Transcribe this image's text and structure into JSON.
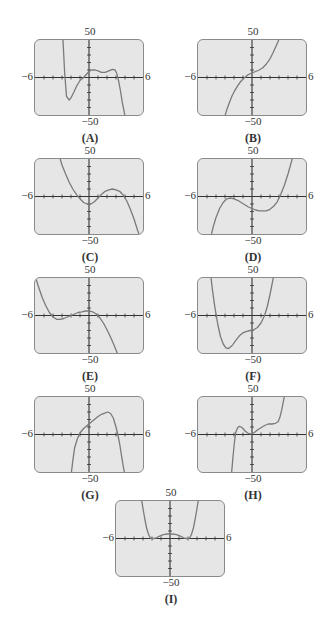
{
  "window": {
    "xmin": -6,
    "xmax": 6,
    "ymin": -50,
    "ymax": 50,
    "xscl": 1,
    "yscl": 10
  },
  "axis_labels": {
    "xmin": "−6",
    "xmax": "6",
    "ymax": "50",
    "ymin": "−50"
  },
  "chart_data": [
    {
      "label": "(A)",
      "type": "line",
      "xlim": [
        -6,
        6
      ],
      "ylim": [
        -50,
        50
      ],
      "description": "degree-5 polynomial, negative leading coefficient; local min near (-2.5,-30), small bumps between 0 and 3, falls steeply after 3.2",
      "x": [
        -2.9,
        -2.7,
        -2.5,
        -2.2,
        -2,
        -1.7,
        -1.4,
        -1,
        -0.6,
        -0.3,
        0,
        0.3,
        0.7,
        1,
        1.4,
        1.8,
        2.2,
        2.6,
        2.9,
        3.1,
        3.3,
        3.5,
        3.7,
        3.9,
        4.05
      ],
      "y": [
        52,
        5,
        -25,
        -30,
        -27,
        -20,
        -12,
        -4,
        0,
        4,
        8,
        10,
        10,
        9,
        7,
        7,
        9,
        11,
        10,
        5,
        -5,
        -18,
        -33,
        -45,
        -55
      ]
    },
    {
      "label": "(B)",
      "type": "line",
      "xlim": [
        -6,
        6
      ],
      "ylim": [
        -50,
        50
      ],
      "description": "increasing cubic with inflection near (0,8)",
      "x": [
        -3.1,
        -2.8,
        -2.5,
        -2.2,
        -1.9,
        -1.6,
        -1.3,
        -1,
        -0.7,
        -0.4,
        0,
        0.4,
        0.8,
        1.2,
        1.6,
        2,
        2.3,
        2.6,
        2.9,
        3.1
      ],
      "y": [
        -55,
        -43,
        -33,
        -24,
        -17,
        -11,
        -6,
        -2,
        1,
        4,
        6,
        8,
        10,
        13,
        18,
        25,
        32,
        40,
        48,
        55
      ]
    },
    {
      "label": "(C)",
      "type": "line",
      "xlim": [
        -6,
        6
      ],
      "ylim": [
        -50,
        50
      ],
      "description": "negative cubic; min near (-0.3,-13), max near (2.8,10)",
      "x": [
        -3.2,
        -3,
        -2.6,
        -2.2,
        -1.8,
        -1.4,
        -1,
        -0.6,
        -0.2,
        0.2,
        0.6,
        1,
        1.4,
        1.8,
        2.2,
        2.6,
        3,
        3.4,
        3.8,
        4.2,
        4.6,
        5,
        5.4,
        5.7
      ],
      "y": [
        50,
        42,
        30,
        19,
        10,
        3,
        -3,
        -8,
        -10,
        -10,
        -7,
        -2,
        3,
        7,
        9,
        10,
        9,
        7,
        2,
        -6,
        -17,
        -30,
        -45,
        -55
      ]
    },
    {
      "label": "(D)",
      "type": "line",
      "xlim": [
        -6,
        6
      ],
      "ylim": [
        -50,
        50
      ],
      "description": "positive cubic; max near (-2.5,-2), min near (1.8,-17)",
      "x": [
        -4.6,
        -4.3,
        -4,
        -3.6,
        -3.2,
        -2.8,
        -2.4,
        -2,
        -1.6,
        -1.2,
        -0.8,
        -0.4,
        0,
        0.4,
        0.8,
        1.2,
        1.6,
        2,
        2.4,
        2.8,
        3.2,
        3.6,
        4,
        4.3,
        4.6
      ],
      "y": [
        -55,
        -40,
        -28,
        -16,
        -8,
        -3,
        -2,
        -3,
        -5,
        -8,
        -11,
        -14,
        -16,
        -18,
        -19,
        -19,
        -19,
        -17,
        -13,
        -7,
        3,
        15,
        30,
        43,
        55
      ]
    },
    {
      "label": "(E)",
      "type": "line",
      "xlim": [
        -6,
        6
      ],
      "ylim": [
        -50,
        50
      ],
      "description": "negative cubic; min near (-3.5,-5), max near (0,7)",
      "x": [
        -6,
        -5.6,
        -5.2,
        -4.8,
        -4.4,
        -4,
        -3.6,
        -3.2,
        -2.8,
        -2.4,
        -2,
        -1.6,
        -1.2,
        -0.8,
        -0.4,
        0,
        0.4,
        0.8,
        1.2,
        1.6,
        2,
        2.4,
        2.8,
        3.2,
        3.5
      ],
      "y": [
        53,
        38,
        24,
        13,
        4,
        -2,
        -5,
        -5,
        -4,
        -2,
        0,
        2,
        4,
        5,
        6,
        6,
        5,
        2,
        -3,
        -10,
        -19,
        -29,
        -40,
        -52,
        -60
      ]
    },
    {
      "label": "(F)",
      "type": "line",
      "xlim": [
        -6,
        6
      ],
      "ylim": [
        -50,
        50
      ],
      "description": "quartic-like; deep min near (-3,-45), shelf near (0,-20), rises steeply after 1.5",
      "x": [
        -4.6,
        -4.4,
        -4.2,
        -4,
        -3.8,
        -3.5,
        -3.2,
        -2.9,
        -2.6,
        -2.2,
        -1.8,
        -1.4,
        -1,
        -0.6,
        -0.2,
        0.2,
        0.6,
        1,
        1.4,
        1.7,
        2,
        2.2,
        2.45
      ],
      "y": [
        55,
        35,
        17,
        2,
        -12,
        -28,
        -38,
        -43,
        -44,
        -40,
        -33,
        -27,
        -23,
        -21,
        -20,
        -19,
        -16,
        -10,
        0,
        12,
        28,
        40,
        55
      ]
    },
    {
      "label": "(G)",
      "type": "line",
      "xlim": [
        -6,
        6
      ],
      "ylim": [
        -50,
        50
      ],
      "description": "concave-down curve; crosses near -1.2, peak near (2.3,30), drops steeply after 3.3",
      "x": [
        -2,
        -1.8,
        -1.6,
        -1.3,
        -1,
        -0.6,
        -0.2,
        0.2,
        0.6,
        1,
        1.4,
        1.8,
        2.1,
        2.4,
        2.7,
        3,
        3.2,
        3.4,
        3.6,
        3.8,
        4
      ],
      "y": [
        -55,
        -35,
        -18,
        -6,
        2,
        8,
        12,
        16,
        20,
        24,
        27,
        29,
        30,
        28,
        22,
        10,
        0,
        -12,
        -27,
        -42,
        -55
      ]
    },
    {
      "label": "(H)",
      "type": "line",
      "xlim": [
        -6,
        6
      ],
      "ylim": [
        -50,
        50
      ],
      "description": "positive quintic; bump near (-1.5,10), dip near (0,1), bump near (2.2,15), rises steeply after 3.3",
      "x": [
        -2.3,
        -2.2,
        -2.1,
        -2,
        -1.9,
        -1.8,
        -1.6,
        -1.4,
        -1.2,
        -1,
        -0.8,
        -0.5,
        -0.2,
        0,
        0.3,
        0.6,
        1,
        1.4,
        1.8,
        2.2,
        2.6,
        2.9,
        3.1,
        3.3,
        3.5,
        3.7
      ],
      "y": [
        -55,
        -42,
        -28,
        -16,
        -5,
        3,
        9,
        11,
        10,
        8,
        5,
        2,
        1,
        1,
        3,
        6,
        9,
        12,
        14,
        14,
        15,
        17,
        23,
        33,
        45,
        58
      ]
    },
    {
      "label": "(I)",
      "type": "line",
      "xlim": [
        -6,
        6
      ],
      "ylim": [
        -50,
        50
      ],
      "description": "even quartic W-shape; minima near (±2,0), local max near (0,6)",
      "x": [
        -3.2,
        -3,
        -2.8,
        -2.6,
        -2.4,
        -2.2,
        -2,
        -1.8,
        -1.5,
        -1.2,
        -0.9,
        -0.6,
        -0.3,
        0,
        0.3,
        0.6,
        0.9,
        1.2,
        1.5,
        1.8,
        2,
        2.2,
        2.4,
        2.6,
        2.8,
        3,
        3.2
      ],
      "y": [
        55,
        40,
        26,
        14,
        6,
        1,
        0,
        0,
        1,
        3,
        4.5,
        5.5,
        6,
        6,
        6,
        5.5,
        4.5,
        3,
        1,
        0,
        0,
        1,
        6,
        14,
        26,
        40,
        55
      ]
    }
  ]
}
